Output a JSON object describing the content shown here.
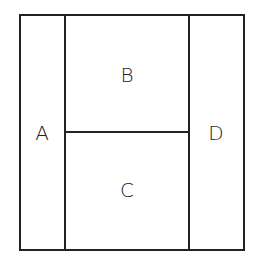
{
  "diagram": {
    "regions": [
      {
        "id": "A",
        "label": "A"
      },
      {
        "id": "B",
        "label": "B"
      },
      {
        "id": "C",
        "label": "C"
      },
      {
        "id": "D",
        "label": "D"
      }
    ],
    "line_color": "#222222"
  }
}
